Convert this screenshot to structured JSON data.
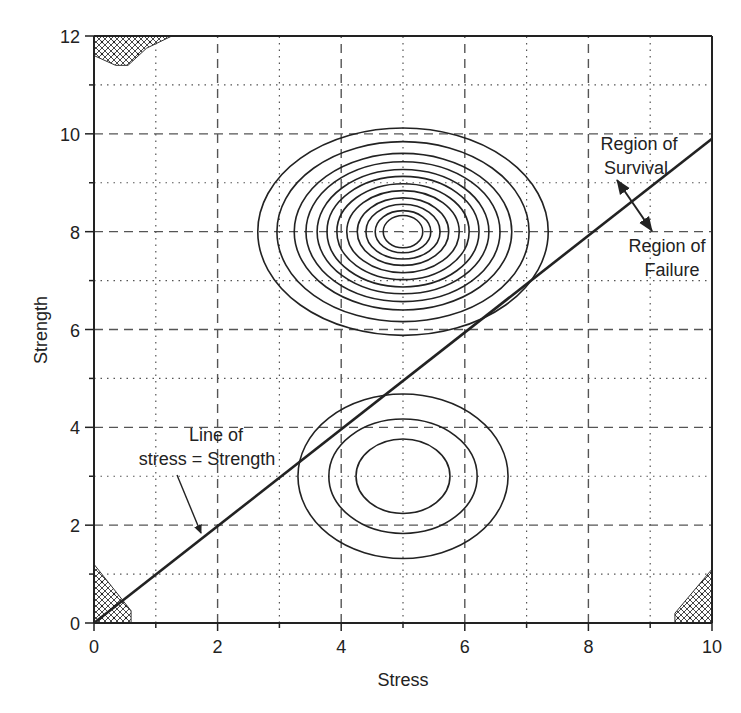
{
  "chart_data": {
    "type": "contour",
    "title": "",
    "xlabel": "Stress",
    "ylabel": "Strength",
    "xlim": [
      0,
      10
    ],
    "ylim": [
      0,
      12
    ],
    "x_ticks": [
      0,
      2,
      4,
      6,
      8,
      10
    ],
    "y_ticks": [
      0,
      2,
      4,
      6,
      8,
      10,
      12
    ],
    "x_tick_labels": [
      "0",
      "2",
      "4",
      "6",
      "8",
      "10"
    ],
    "y_tick_labels": [
      "0",
      "2",
      "4",
      "6",
      "8",
      "10",
      "12"
    ],
    "grid": {
      "major": "dashed at even values",
      "minor": "dotted at odd values"
    },
    "series": [
      {
        "name": "Strength distribution contours",
        "center": [
          5,
          8
        ],
        "contour_count": 12,
        "semi_axes_x": [
          2.35,
          2.04,
          1.76,
          1.57,
          1.39,
          1.23,
          1.07,
          0.91,
          0.74,
          0.6,
          0.45,
          0.32
        ],
        "semi_axes_y": [
          2.12,
          1.84,
          1.6,
          1.43,
          1.27,
          1.13,
          0.98,
          0.84,
          0.69,
          0.56,
          0.43,
          0.33
        ]
      },
      {
        "name": "Stress distribution contours",
        "center": [
          5,
          3
        ],
        "contour_count": 3,
        "semi_axes_x": [
          1.7,
          1.2,
          0.76
        ],
        "semi_axes_y": [
          1.68,
          1.17,
          0.76
        ]
      },
      {
        "name": "Line of stress = Strength",
        "type": "line",
        "x": [
          0,
          10
        ],
        "y": [
          0,
          9.9
        ]
      }
    ],
    "hatched_regions": [
      {
        "location": "top-left",
        "polygon": [
          [
            0,
            12
          ],
          [
            1.26,
            12
          ],
          [
            0.85,
            11.75
          ],
          [
            0.55,
            11.4
          ],
          [
            0.35,
            11.4
          ],
          [
            0,
            11.6
          ]
        ]
      },
      {
        "location": "bottom-left",
        "polygon": [
          [
            0,
            0
          ],
          [
            0.6,
            0
          ],
          [
            0.6,
            0.25
          ],
          [
            0,
            1.2
          ]
        ]
      },
      {
        "location": "bottom-right",
        "polygon": [
          [
            10,
            0
          ],
          [
            9.4,
            0
          ],
          [
            9.4,
            0.2
          ],
          [
            10,
            1.1
          ]
        ]
      }
    ],
    "annotations": [
      {
        "text": "Region of",
        "text2": "Survival",
        "position": [
          8.3,
          10.1
        ]
      },
      {
        "text": "Region of",
        "text2": "Failure",
        "position": [
          9.0,
          7.6
        ]
      },
      {
        "text": "Line of",
        "text2": "stress = Strength",
        "position": [
          2.4,
          3.6
        ]
      }
    ]
  },
  "labels": {
    "xlabel": "Stress",
    "ylabel": "Strength",
    "survival_line1": "Region of",
    "survival_line2": "Survival",
    "failure_line1": "Region of",
    "failure_line2": "Failure",
    "line_label1": "Line of",
    "line_label2": "stress = Strength"
  },
  "colors": {
    "ink": "#222222",
    "grid": "#555555",
    "background": "#ffffff"
  }
}
